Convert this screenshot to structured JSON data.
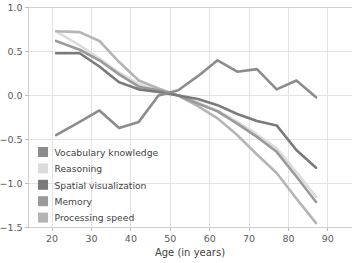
{
  "chart_data": {
    "type": "line",
    "title": "",
    "xlabel": "Age (in years)",
    "ylabel": "",
    "xlim": [
      14,
      96
    ],
    "ylim": [
      -1.5,
      1.0
    ],
    "xticks": [
      20,
      30,
      40,
      50,
      60,
      70,
      80,
      90
    ],
    "xtick_labels": [
      "20",
      "30",
      "40",
      "50",
      "60",
      "70",
      "80",
      "90"
    ],
    "yticks": [
      1.0,
      0.5,
      0.0,
      -0.5,
      -1.0,
      -1.5
    ],
    "ytick_labels": [
      "1.0",
      "0.5",
      "0.0",
      "−0.5",
      "−1.0",
      "−1.5"
    ],
    "grid": true,
    "legend_position": "lower-left-inside",
    "series": [
      {
        "name": "Vocabulary knowledge",
        "color": "#8c8c8c",
        "x": [
          21,
          27,
          32,
          37,
          42,
          47,
          52,
          57,
          62,
          67,
          72,
          77,
          82,
          87
        ],
        "values": [
          -0.45,
          -0.3,
          -0.17,
          -0.37,
          -0.3,
          0.0,
          0.06,
          0.22,
          0.4,
          0.27,
          0.3,
          0.07,
          0.17,
          -0.02
        ]
      },
      {
        "name": "Reasoning",
        "color": "#dcdcdc",
        "x": [
          21,
          27,
          32,
          37,
          42,
          47,
          52,
          57,
          62,
          67,
          72,
          77,
          82,
          87
        ],
        "values": [
          0.73,
          0.57,
          0.42,
          0.26,
          0.13,
          0.05,
          0.0,
          -0.08,
          -0.17,
          -0.3,
          -0.44,
          -0.6,
          -0.87,
          -1.15
        ]
      },
      {
        "name": "Spatial visualization",
        "color": "#7a7a7a",
        "x": [
          21,
          27,
          32,
          37,
          42,
          47,
          52,
          57,
          62,
          67,
          72,
          77,
          82,
          87
        ],
        "values": [
          0.48,
          0.48,
          0.33,
          0.15,
          0.07,
          0.04,
          0.0,
          -0.04,
          -0.11,
          -0.21,
          -0.29,
          -0.34,
          -0.62,
          -0.82
        ]
      },
      {
        "name": "Memory",
        "color": "#9a9a9a",
        "x": [
          21,
          27,
          32,
          37,
          42,
          47,
          52,
          57,
          62,
          67,
          72,
          77,
          82,
          87
        ],
        "values": [
          0.62,
          0.52,
          0.4,
          0.24,
          0.1,
          0.06,
          0.0,
          -0.09,
          -0.18,
          -0.32,
          -0.47,
          -0.64,
          -0.92,
          -1.21
        ]
      },
      {
        "name": "Processing speed",
        "color": "#b4b4b4",
        "x": [
          21,
          27,
          32,
          37,
          42,
          47,
          52,
          57,
          62,
          67,
          72,
          77,
          82,
          87
        ],
        "values": [
          0.73,
          0.72,
          0.62,
          0.38,
          0.17,
          0.08,
          0.0,
          -0.12,
          -0.26,
          -0.45,
          -0.67,
          -0.88,
          -1.17,
          -1.45
        ]
      }
    ]
  },
  "legend": {
    "items": [
      {
        "label": "Vocabulary knowledge",
        "color": "#8c8c8c"
      },
      {
        "label": "Reasoning",
        "color": "#dcdcdc"
      },
      {
        "label": "Spatial visualization",
        "color": "#7a7a7a"
      },
      {
        "label": "Memory",
        "color": "#9a9a9a"
      },
      {
        "label": "Processing speed",
        "color": "#b4b4b4"
      }
    ]
  },
  "style": {
    "grid_color": "#e3e3e3",
    "frame_color": "#cfcfcf",
    "text_color": "#3f3f3f",
    "background": "#ffffff"
  }
}
